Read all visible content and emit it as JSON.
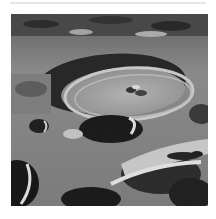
{
  "image": {
    "subject": "lunar-surface-crater",
    "colors": {
      "background": "#ffffff",
      "regolith_mid": "#8a8a8a",
      "highlight": "#e8e8e8",
      "shadow": "#0a0a0a"
    }
  },
  "caption": {
    "visible": "partial",
    "legible": false
  }
}
